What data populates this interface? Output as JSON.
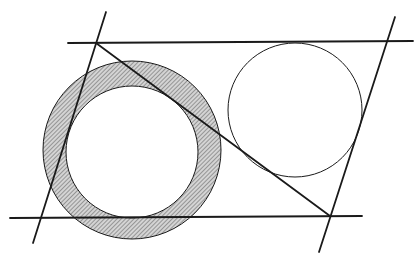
{
  "figure": {
    "width": 418,
    "height": 257,
    "background": "#ffffff",
    "stroke_color": "#1a1a1a",
    "hatch_color": "#555555",
    "annulus": {
      "cx": 132,
      "cy": 150,
      "r_outer": 89,
      "r_inner": 66
    },
    "inscribed_circle": {
      "cx": 295,
      "cy": 110,
      "r": 67
    },
    "lines": [
      {
        "name": "top-line",
        "x1": 68,
        "y1": 43,
        "x2": 413,
        "y2": 41
      },
      {
        "name": "bottom-line",
        "x1": 10,
        "y1": 218,
        "x2": 362,
        "y2": 216
      },
      {
        "name": "left-line",
        "x1": 106,
        "y1": 12,
        "x2": 33,
        "y2": 243
      },
      {
        "name": "right-line",
        "x1": 395,
        "y1": 17,
        "x2": 319,
        "y2": 252
      },
      {
        "name": "diagonal-line",
        "x1": 96,
        "y1": 43,
        "x2": 330,
        "y2": 216
      }
    ]
  }
}
